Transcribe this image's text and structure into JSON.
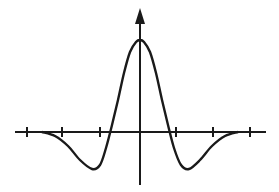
{
  "figure": {
    "stroke_color": "#1a1a1a",
    "background": "#ffffff"
  },
  "axes": {
    "x_axis": {
      "x1": 15,
      "x2": 266,
      "y": 132
    },
    "y_axis": {
      "x": 140,
      "y1": 12,
      "y2": 185
    },
    "x_ticks": [
      27,
      62,
      100,
      176,
      213,
      250
    ],
    "tick_half_length": 5
  },
  "curve": {
    "points": [
      [
        42,
        132
      ],
      [
        55,
        136
      ],
      [
        68,
        146
      ],
      [
        80,
        160
      ],
      [
        92,
        169
      ],
      [
        100,
        165
      ],
      [
        106,
        148
      ],
      [
        112,
        125
      ],
      [
        118,
        100
      ],
      [
        124,
        73
      ],
      [
        130,
        52
      ],
      [
        136,
        42
      ],
      [
        140,
        40
      ],
      [
        144,
        42
      ],
      [
        150,
        52
      ],
      [
        156,
        73
      ],
      [
        162,
        100
      ],
      [
        168,
        125
      ],
      [
        174,
        148
      ],
      [
        181,
        165
      ],
      [
        189,
        169
      ],
      [
        200,
        160
      ],
      [
        212,
        146
      ],
      [
        225,
        136
      ],
      [
        238,
        132
      ]
    ]
  }
}
